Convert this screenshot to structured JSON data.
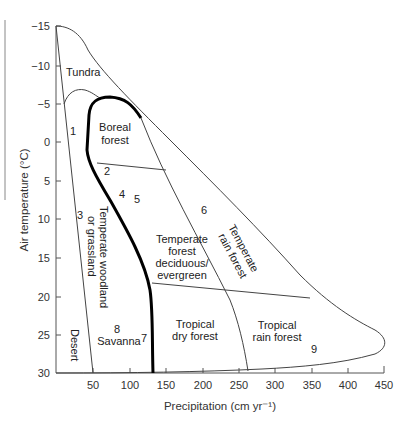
{
  "diagram": {
    "type": "biome-climate-diagram",
    "x_axis": {
      "label": "Precipitation (cm yr⁻¹)",
      "ticks": [
        "50",
        "100",
        "150",
        "200",
        "250",
        "300",
        "350",
        "400",
        "450"
      ],
      "range": [
        0,
        450
      ]
    },
    "y_axis": {
      "label": "Air temperature (°C)",
      "ticks": [
        "−15",
        "−10",
        "−5",
        "0",
        "5",
        "10",
        "15",
        "20",
        "25",
        "30"
      ],
      "range": [
        -15,
        30
      ],
      "inverted": true
    },
    "biomes": {
      "tundra": "Tundra",
      "boreal_1": "Boreal",
      "boreal_2": "forest",
      "woodland_1": "Temperate woodland",
      "woodland_2": "or grassland",
      "temp_forest_1": "Temperate",
      "temp_forest_2": "forest",
      "temp_forest_3": "deciduous/",
      "temp_forest_4": "evergreen",
      "temp_rain_1": "Temperate",
      "temp_rain_2": "rain forest",
      "desert": "Desert",
      "savanna": "Savanna",
      "trop_dry_1": "Tropical",
      "trop_dry_2": "dry forest",
      "trop_rain_1": "Tropical",
      "trop_rain_2": "rain forest"
    },
    "markers": [
      "1",
      "2",
      "3",
      "4",
      "5",
      "6",
      "7",
      "8",
      "9"
    ],
    "colors": {
      "line": "#444444",
      "bold_line": "#000000",
      "text": "#222222"
    }
  }
}
